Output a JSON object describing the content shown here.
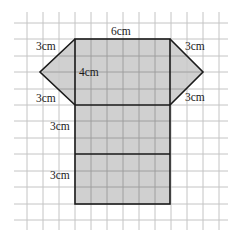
{
  "diagram": {
    "type": "net-of-triangular-prism-on-grid",
    "grid": {
      "color": "#c4c4c4",
      "cell_px": 16
    },
    "colors": {
      "fill": "#c8c8c8",
      "outline": "#1a1a1a",
      "background": "#ffffff"
    },
    "labels": {
      "top_width": "6cm",
      "left_upper_slant": "3cm",
      "left_lower_slant": "3cm",
      "right_upper_slant": "3cm",
      "right_lower_slant": "3cm",
      "height_top_rect": "4cm",
      "middle_rect_height": "3cm",
      "bottom_rect_height": "3cm"
    }
  }
}
